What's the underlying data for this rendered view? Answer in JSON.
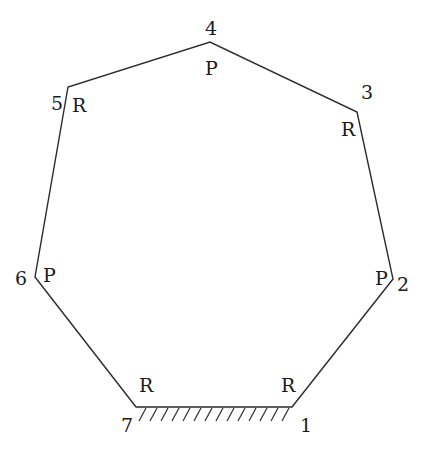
{
  "diagram": {
    "type": "closed-chain linkage (heptagon)",
    "ground_link": "7-1",
    "vertices": [
      {
        "id": "1",
        "label": "1",
        "joint": "R",
        "x": 292,
        "y": 407,
        "lx": 300,
        "ly": 432,
        "jx": 281,
        "jy": 392
      },
      {
        "id": "2",
        "label": "2",
        "joint": "P",
        "x": 393,
        "y": 279,
        "lx": 397,
        "ly": 291,
        "jx": 375,
        "jy": 285
      },
      {
        "id": "3",
        "label": "3",
        "joint": "R",
        "x": 357,
        "y": 112,
        "lx": 361,
        "ly": 99,
        "jx": 341,
        "jy": 136
      },
      {
        "id": "4",
        "label": "4",
        "joint": "P",
        "x": 210,
        "y": 42,
        "lx": 205,
        "ly": 35,
        "jx": 205,
        "jy": 75
      },
      {
        "id": "5",
        "label": "5",
        "joint": "R",
        "x": 68,
        "y": 87,
        "lx": 51,
        "ly": 110,
        "jx": 72,
        "jy": 112
      },
      {
        "id": "6",
        "label": "6",
        "joint": "P",
        "x": 35,
        "y": 277,
        "lx": 15,
        "ly": 285,
        "jx": 43,
        "jy": 282
      },
      {
        "id": "7",
        "label": "7",
        "joint": "R",
        "x": 136,
        "y": 407,
        "lx": 121,
        "ly": 432,
        "jx": 139,
        "jy": 392
      }
    ],
    "colors": {
      "line": "#2a2a2a",
      "text": "#1a1a1a",
      "background": "#ffffff"
    }
  }
}
